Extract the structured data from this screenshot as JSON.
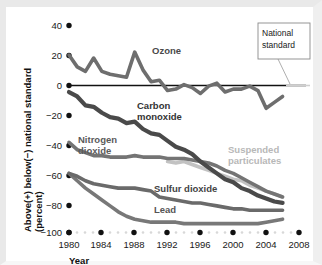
{
  "chart_data": {
    "type": "line",
    "title": "",
    "xlabel": "Year",
    "ylabel": "Above(+) below(−) national standard (percent)",
    "ylabel_line1": "Above(+) below(−) national standard",
    "ylabel_line2": "(percent)",
    "xlim": [
      1980,
      2008
    ],
    "ylim": [
      -100,
      40
    ],
    "xticks": [
      "1980",
      "1984",
      "1988",
      "1992",
      "1996",
      "2000",
      "2004",
      "2008"
    ],
    "xtick_values": [
      1980,
      1984,
      1988,
      1992,
      1996,
      2000,
      2004,
      2008
    ],
    "yticks": [
      "40",
      "20",
      "0",
      "−20",
      "−40",
      "−60",
      "−80",
      "−100"
    ],
    "ytick_values": [
      40,
      20,
      0,
      -20,
      -40,
      -60,
      -80,
      -100
    ],
    "grid": false,
    "legend_position": "inline-labels",
    "reference_line": {
      "value": 0,
      "label": "National standard",
      "color": "#111111"
    },
    "annotations": [
      {
        "name": "national-standard-callout",
        "text": "National standard",
        "x": 2004,
        "y": 36
      }
    ],
    "series": [
      {
        "name": "Ozone",
        "label": "Ozone",
        "color": "#6e6e6e",
        "label_color": "#4a4a4a",
        "x": [
          1980,
          1981,
          1982,
          1983,
          1984,
          1985,
          1986,
          1987,
          1988,
          1989,
          1990,
          1991,
          1992,
          1993,
          1994,
          1995,
          1996,
          1997,
          1998,
          1999,
          2000,
          2001,
          2002,
          2003,
          2004,
          2005,
          2006
        ],
        "values": [
          20,
          12,
          9,
          18,
          9,
          7,
          6,
          5,
          22,
          10,
          2,
          3,
          -4,
          -3,
          0,
          -2,
          -6,
          -1,
          1,
          -5,
          -3,
          -3,
          -1,
          -4,
          -16,
          -12,
          -8
        ]
      },
      {
        "name": "Carbon monoxide",
        "label": "Carbon monoxide",
        "label_line1": "Carbon",
        "label_line2": "monoxide",
        "color": "#4a4a4a",
        "label_color": "#333333",
        "x": [
          1980,
          1981,
          1982,
          1983,
          1984,
          1985,
          1986,
          1987,
          1988,
          1989,
          1990,
          1991,
          1992,
          1993,
          1994,
          1995,
          1996,
          1997,
          1998,
          1999,
          2000,
          2001,
          2002,
          2003,
          2004,
          2005,
          2006
        ],
        "values": [
          -5,
          -8,
          -14,
          -15,
          -19,
          -22,
          -23,
          -26,
          -25,
          -30,
          -33,
          -34,
          -38,
          -42,
          -44,
          -47,
          -52,
          -56,
          -60,
          -64,
          -66,
          -70,
          -72,
          -75,
          -77,
          -79,
          -80
        ]
      },
      {
        "name": "Nitrogen dioxide",
        "label": "Nitrogen dioxide",
        "label_line1": "Nitrogen",
        "label_line2": "dioxide",
        "color": "#747474",
        "label_color": "#555555",
        "x": [
          1980,
          1981,
          1982,
          1983,
          1984,
          1985,
          1986,
          1987,
          1988,
          1989,
          1990,
          1991,
          1992,
          1993,
          1994,
          1995,
          1996,
          1997,
          1998,
          1999,
          2000,
          2001,
          2002,
          2003,
          2004,
          2005,
          2006
        ],
        "values": [
          -39,
          -44,
          -46,
          -48,
          -48,
          -49,
          -49,
          -49,
          -48,
          -49,
          -49,
          -49,
          -50,
          -50,
          -50,
          -51,
          -52,
          -53,
          -55,
          -58,
          -60,
          -63,
          -66,
          -69,
          -72,
          -74,
          -76
        ]
      },
      {
        "name": "Sulfur dioxide",
        "label": "Sulfur dioxide",
        "color": "#6a6a6a",
        "label_color": "#444444",
        "x": [
          1980,
          1981,
          1982,
          1983,
          1984,
          1985,
          1986,
          1987,
          1988,
          1989,
          1990,
          1991,
          1992,
          1993,
          1994,
          1995,
          1996,
          1997,
          1998,
          1999,
          2000,
          2001,
          2002,
          2003,
          2004,
          2005,
          2006
        ],
        "values": [
          -60,
          -62,
          -65,
          -67,
          -68,
          -69,
          -70,
          -70,
          -70,
          -71,
          -72,
          -76,
          -77,
          -78,
          -79,
          -80,
          -80,
          -81,
          -82,
          -83,
          -84,
          -84,
          -85,
          -85,
          -85,
          -85,
          -85
        ]
      },
      {
        "name": "Lead",
        "label": "Lead",
        "color": "#787878",
        "label_color": "#555555",
        "x": [
          1980,
          1981,
          1982,
          1983,
          1984,
          1985,
          1986,
          1987,
          1988,
          1989,
          1990,
          1991,
          1992,
          1993,
          1994,
          1995,
          1996,
          1997,
          1998,
          1999,
          2000,
          2001,
          2002,
          2003,
          2004,
          2005,
          2006
        ],
        "values": [
          -60,
          -65,
          -70,
          -74,
          -78,
          -82,
          -86,
          -89,
          -91,
          -92,
          -93,
          -93,
          -93,
          -93,
          -94,
          -94,
          -94,
          -94,
          -94,
          -94,
          -94,
          -94,
          -94,
          -94,
          -93,
          -92,
          -91
        ]
      },
      {
        "name": "Suspended particulates",
        "label": "Suspended particulates",
        "label_line1": "Suspended",
        "label_line2": "particulates",
        "color": "#c2c2c2",
        "label_color": "#b3b3b3",
        "x": [
          1992,
          1993,
          1994,
          1995,
          1996,
          1997,
          1998,
          1999,
          2000,
          2001,
          2002,
          2003,
          2004,
          2005,
          2006
        ],
        "values": [
          -52,
          -53,
          -52,
          -54,
          -56,
          -58,
          -60,
          -62,
          -64,
          -65,
          -68,
          -70,
          -72,
          -74,
          -76
        ]
      }
    ]
  },
  "axes": {
    "x_title": "Year",
    "y_title_line1": "Above(+) below(−) national standard",
    "y_title_line2": "(percent)"
  },
  "callout": {
    "line1": "National",
    "line2": "standard"
  }
}
